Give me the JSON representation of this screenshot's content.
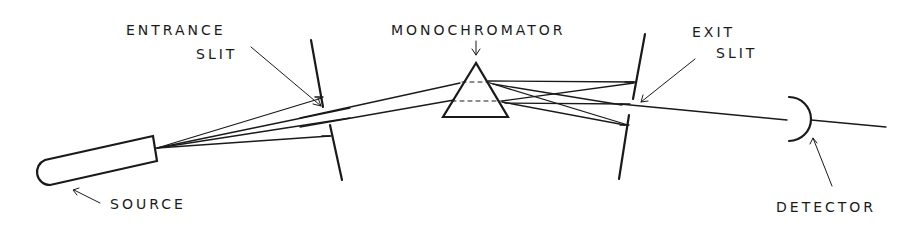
{
  "diagram": {
    "labels": {
      "entrance_line1": "ENTRANCE",
      "entrance_line2": "SLIT",
      "monochromator": "MONOCHROMATOR",
      "exit_line1": "EXIT",
      "exit_line2": "SLIT",
      "source": "SOURCE",
      "detector": "DETECTOR"
    },
    "components": [
      {
        "id": "source",
        "shape": "capsule",
        "label": "SOURCE"
      },
      {
        "id": "entrance-slit",
        "shape": "slit",
        "label": "ENTRANCE SLIT"
      },
      {
        "id": "monochromator",
        "shape": "prism",
        "label": "MONOCHROMATOR"
      },
      {
        "id": "exit-slit",
        "shape": "slit",
        "label": "EXIT SLIT"
      },
      {
        "id": "detector",
        "shape": "arc",
        "label": "DETECTOR"
      }
    ],
    "flow": [
      "source",
      "entrance-slit",
      "monochromator",
      "exit-slit",
      "detector"
    ],
    "colors": {
      "ink": "#1a1a1a",
      "background": "#ffffff"
    }
  }
}
